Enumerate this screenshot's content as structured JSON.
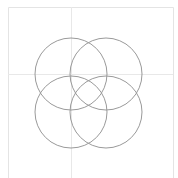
{
  "canvas": {
    "width": 178,
    "height": 178,
    "background": "#ffffff"
  },
  "frame": {
    "left": 8,
    "right": 173,
    "top": 7,
    "bottom": 178,
    "color": "#e4e4e4"
  },
  "gridlines": {
    "color": "#e8e8e8",
    "vertical_x": 71,
    "horizontal_y": 74
  },
  "circles": {
    "stroke": "#9a9a9a",
    "stroke_width": 1,
    "items": [
      {
        "name": "top-left-circle",
        "cx": 71,
        "cy": 74,
        "r": 36
      },
      {
        "name": "top-right-circle",
        "cx": 106,
        "cy": 74,
        "r": 36
      },
      {
        "name": "bottom-right-circle",
        "cx": 106,
        "cy": 112,
        "r": 36
      },
      {
        "name": "bottom-left-circle",
        "cx": 71,
        "cy": 112,
        "r": 36
      }
    ]
  }
}
